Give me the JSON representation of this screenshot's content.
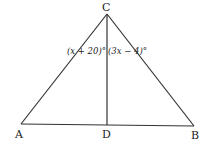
{
  "diagram": {
    "type": "triangle",
    "points": {
      "A": {
        "label": "A"
      },
      "B": {
        "label": "B"
      },
      "C": {
        "label": "C"
      },
      "D": {
        "label": "D"
      }
    },
    "segments": [
      "CA",
      "CB",
      "AB",
      "CD"
    ],
    "angles": {
      "ACD": "(x + 20)°",
      "DCB": "(3x − 4)°"
    }
  }
}
